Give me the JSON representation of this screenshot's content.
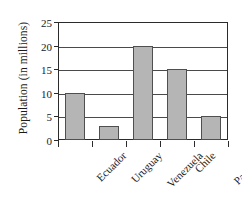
{
  "chart_data": {
    "type": "bar",
    "title": "",
    "subtitle": "",
    "xlabel": "",
    "ylabel": "Population (in millions)",
    "categories": [
      "Ecuador",
      "Uruguay",
      "Venezuela",
      "Chile",
      "Paraguay"
    ],
    "values": [
      10,
      3,
      20,
      15,
      5
    ],
    "ylim": [
      0,
      25
    ],
    "ytick_labels": [
      "0",
      "5",
      "10",
      "15",
      "20",
      "25"
    ],
    "ytick_values": [
      0,
      5,
      10,
      15,
      20,
      25
    ],
    "grid": "horizontal",
    "legend": "none",
    "orientation": "vertical",
    "bar_color": "#b5b5b5",
    "bar_edge_color": "#4f4f4f",
    "axis_color": "#2b2b2b",
    "background_color": "#ffffff"
  }
}
